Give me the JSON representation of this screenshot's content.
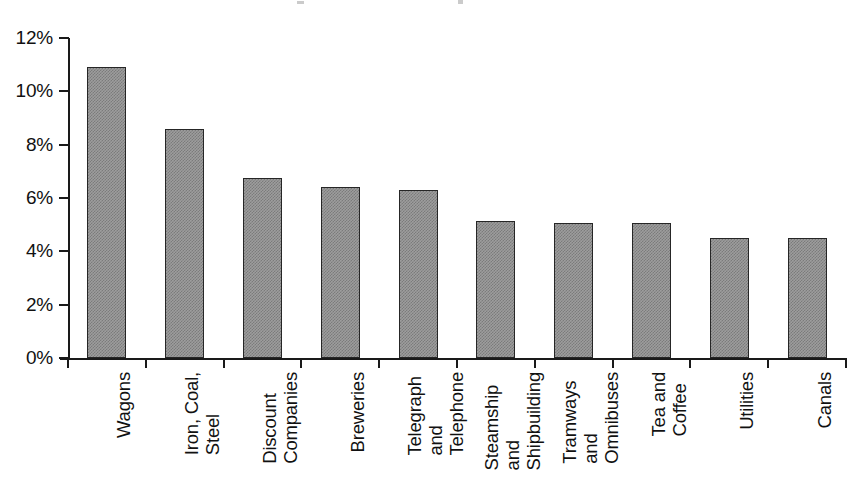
{
  "chart_data": {
    "type": "bar",
    "title": "",
    "xlabel": "",
    "ylabel": "",
    "ylim": [
      0,
      12
    ],
    "grid": false,
    "legend": null,
    "y_tick_labels": [
      "12%",
      "10%",
      "8%",
      "6%",
      "4%",
      "2%",
      "0%"
    ],
    "y_tick_values": [
      12,
      10,
      8,
      6,
      4,
      2,
      0
    ],
    "categories": [
      "Wagons",
      "Iron, Coal, Steel",
      "Discount Companies",
      "Breweries",
      "Telegraph and Telephone",
      "Steamship and Shipbuilding",
      "Tramways and Omnibuses",
      "Tea and Coffee",
      "Utilities",
      "Canals"
    ],
    "category_label_lines": [
      [
        "Wagons"
      ],
      [
        "Iron, Coal,",
        "Steel"
      ],
      [
        "Discount",
        "Companies"
      ],
      [
        "Breweries"
      ],
      [
        "Telegraph",
        "and",
        "Telephone"
      ],
      [
        "Steamship",
        "and",
        "Shipbuilding"
      ],
      [
        "Tramways",
        "and",
        "Omnibuses"
      ],
      [
        "Tea and",
        "Coffee"
      ],
      [
        "Utilities"
      ],
      [
        "Canals"
      ]
    ],
    "values": [
      10.9,
      8.6,
      6.75,
      6.4,
      6.3,
      5.15,
      5.05,
      5.05,
      4.5,
      4.5
    ],
    "value_labels": [
      "10.9%",
      "8.6%",
      "6.75%",
      "6.4%",
      "6.3%",
      "5.15%",
      "5.05%",
      "5.05%",
      "4.5%",
      "4.5%"
    ],
    "colors": {
      "bar_fill": "#9d9d9d",
      "bar_hatch": "#7b7b7b",
      "bar_border": "#262626",
      "axis": "#1a1a1a",
      "text": "#111111",
      "background": "#ffffff"
    }
  },
  "axis_geometry": {
    "plot_left": 68,
    "plot_right": 846,
    "baseline_y": 358,
    "top_y": 38,
    "bar_width": 39,
    "category_step": 77.8
  }
}
